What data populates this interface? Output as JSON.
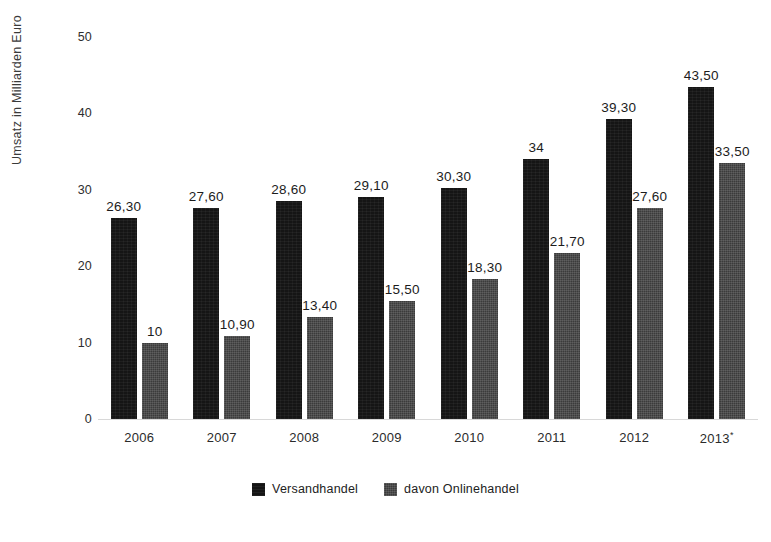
{
  "chart_data": {
    "type": "bar",
    "title": "",
    "subtitle": "",
    "xlabel": "",
    "ylabel": "Umsatz in Milliarden Euro",
    "categories": [
      "2006",
      "2007",
      "2008",
      "2009",
      "2010",
      "2011",
      "2012",
      "2013*"
    ],
    "category_notes": {
      "2013*": "asterisk marks a forecast/estimated value"
    },
    "series": [
      {
        "name": "Versandhandel",
        "color": "#151515",
        "values": [
          26.3,
          27.6,
          28.6,
          29.1,
          30.3,
          34,
          39.3,
          43.5
        ],
        "labels": [
          "26,30",
          "27,60",
          "28,60",
          "29,10",
          "30,30",
          "34",
          "39,30",
          "43,50"
        ]
      },
      {
        "name": "davon Onlinehandel",
        "color": "#3b3b3b",
        "values": [
          10,
          10.9,
          13.4,
          15.5,
          18.3,
          21.7,
          27.6,
          33.5
        ],
        "labels": [
          "10",
          "10,90",
          "13,40",
          "15,50",
          "18,30",
          "21,70",
          "27,60",
          "33,50"
        ]
      }
    ],
    "ylim": [
      0,
      50
    ],
    "ytick_values": [
      0,
      10,
      20,
      30,
      40,
      50
    ],
    "ytick_labels": [
      "0",
      "10",
      "20",
      "30",
      "40",
      "50"
    ],
    "grid": false,
    "legend_position": "bottom-center",
    "background_color": "#ffffff"
  },
  "legend": {
    "items": [
      {
        "label": "Versandhandel",
        "swatch": "legend-swatch-versandhandel"
      },
      {
        "label": "davon Onlinehandel",
        "swatch": "legend-swatch-onlinehandel"
      }
    ]
  },
  "footer": {
    "mark": ""
  }
}
